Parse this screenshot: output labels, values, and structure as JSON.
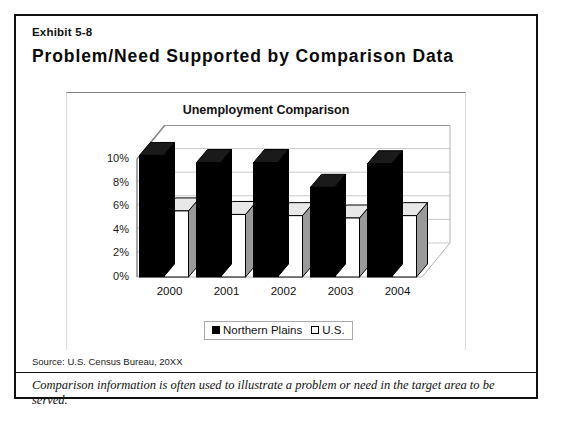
{
  "exhibit": {
    "label": "Exhibit 5-8",
    "title": "Problem/Need Supported by Comparison Data"
  },
  "source": "Source: U.S. Census Bureau, 20XX",
  "footnote": "Comparison information is often used to illustrate a problem or need in the target area to be served.",
  "legend": {
    "items": [
      {
        "label": "Northern Plains",
        "swatch": "black-square"
      },
      {
        "label": "U.S.",
        "swatch": "white-square"
      }
    ]
  },
  "colors": {
    "series_northern_plains": "#000000",
    "series_us": "#ffffff",
    "series_us_side": "#9a9a9a",
    "border": "#111111",
    "gridline": "#c8c8c8"
  },
  "chart_data": {
    "type": "bar",
    "title": "Unemployment Comparison",
    "xlabel": "",
    "ylabel": "",
    "categories": [
      "2000",
      "2001",
      "2002",
      "2003",
      "2004"
    ],
    "series": [
      {
        "name": "Northern Plains",
        "values": [
          10.3,
          9.7,
          9.7,
          7.6,
          9.6
        ]
      },
      {
        "name": "U.S.",
        "values": [
          5.6,
          5.3,
          5.2,
          5.0,
          5.2
        ]
      }
    ],
    "ylim": [
      0,
      10
    ],
    "yticks": [
      0,
      2,
      4,
      6,
      8,
      10
    ],
    "ytick_labels": [
      "0%",
      "2%",
      "4%",
      "6%",
      "8%",
      "10%"
    ],
    "grid": true,
    "legend_position": "bottom",
    "style": "3d-column"
  }
}
